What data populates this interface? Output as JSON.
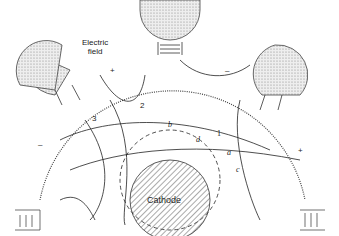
{
  "labels": {
    "electric_field": [
      "Electric",
      "field"
    ],
    "cathode": "Cathode",
    "line_1": "1",
    "line_2": "2",
    "line_3": "3",
    "point_a": "a",
    "point_b": "b",
    "point_c": "c",
    "point_d": "d",
    "plus_top_left": "+",
    "minus_top_right": "–",
    "minus_left": "–",
    "plus_right": "+"
  },
  "colors": {
    "line": "#222222",
    "stipple": "#d8d8d8",
    "background": "#ffffff"
  }
}
